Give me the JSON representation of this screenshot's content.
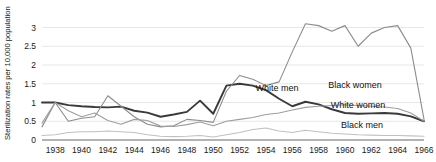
{
  "chart_data": {
    "type": "line",
    "title": "",
    "xlabel": "",
    "ylabel": "Sterilization rates per 10,000 population",
    "xlim": [
      1937,
      1966
    ],
    "ylim": [
      0,
      3.2
    ],
    "yticks": [
      "0",
      "0.5",
      "1",
      "1.5",
      "2",
      "2.5",
      "3"
    ],
    "ytick_values": [
      0,
      0.5,
      1,
      1.5,
      2,
      2.5,
      3
    ],
    "xticks": [
      "1938",
      "1940",
      "1942",
      "1944",
      "1946",
      "1948",
      "1950",
      "1952",
      "1954",
      "1956",
      "1958",
      "1960",
      "1962",
      "1964",
      "1966"
    ],
    "xtick_values": [
      1938,
      1940,
      1942,
      1944,
      1946,
      1948,
      1950,
      1952,
      1954,
      1956,
      1958,
      1960,
      1962,
      1964,
      1966
    ],
    "grid": true,
    "legend": "inline-labels",
    "x": [
      1937,
      1938,
      1939,
      1940,
      1941,
      1942,
      1943,
      1944,
      1945,
      1946,
      1947,
      1948,
      1949,
      1950,
      1951,
      1952,
      1953,
      1954,
      1955,
      1956,
      1957,
      1958,
      1959,
      1960,
      1961,
      1962,
      1963,
      1964,
      1965,
      1966
    ],
    "series": [
      {
        "name": "White men",
        "color": "#3a3a3a",
        "width": 1.9,
        "values": [
          1.0,
          1.0,
          0.93,
          0.9,
          0.88,
          0.87,
          0.89,
          0.78,
          0.73,
          0.62,
          0.68,
          0.75,
          1.05,
          0.7,
          1.45,
          1.5,
          1.45,
          1.33,
          1.1,
          0.9,
          1.02,
          0.95,
          0.82,
          0.72,
          0.7,
          0.71,
          0.72,
          0.7,
          0.63,
          0.5
        ]
      },
      {
        "name": "Black women",
        "color": "#8c8c8c",
        "width": 1.1,
        "values": [
          0.35,
          1.0,
          0.5,
          0.58,
          0.62,
          1.18,
          0.9,
          0.62,
          0.42,
          0.35,
          0.38,
          0.55,
          0.52,
          0.47,
          1.3,
          1.72,
          1.62,
          1.45,
          1.55,
          2.35,
          3.1,
          3.05,
          2.9,
          3.05,
          2.5,
          2.85,
          3.0,
          3.05,
          2.45,
          0.55
        ]
      },
      {
        "name": "White women",
        "color": "#9e9e9e",
        "width": 1.1,
        "values": [
          0.45,
          1.0,
          0.78,
          0.62,
          0.72,
          0.52,
          0.42,
          0.55,
          0.52,
          0.37,
          0.36,
          0.41,
          0.48,
          0.38,
          0.5,
          0.55,
          0.6,
          0.68,
          0.72,
          0.8,
          0.87,
          0.9,
          0.92,
          0.94,
          0.92,
          0.9,
          0.88,
          0.84,
          0.72,
          0.5
        ]
      },
      {
        "name": "Black men",
        "color": "#c0c0c0",
        "width": 1.1,
        "values": [
          0.12,
          0.14,
          0.2,
          0.22,
          0.22,
          0.24,
          0.22,
          0.2,
          0.14,
          0.1,
          0.09,
          0.1,
          0.12,
          0.08,
          0.14,
          0.2,
          0.28,
          0.32,
          0.24,
          0.2,
          0.26,
          0.22,
          0.18,
          0.16,
          0.14,
          0.13,
          0.12,
          0.12,
          0.11,
          0.1
        ]
      }
    ],
    "annotations": [
      {
        "text": "White men",
        "x": 277,
        "y": 91
      },
      {
        "text": "Black women",
        "x": 355,
        "y": 88
      },
      {
        "text": "White women",
        "x": 358,
        "y": 108
      },
      {
        "text": "Black men",
        "x": 362,
        "y": 128
      }
    ]
  }
}
